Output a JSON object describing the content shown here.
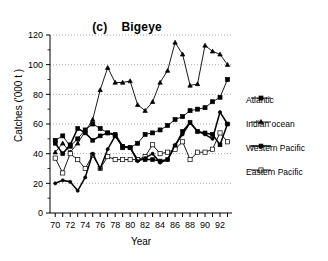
{
  "chart_data": {
    "type": "line",
    "title": "Bigeye",
    "panel_tag": "(c)",
    "xlabel": "Year",
    "ylabel": "Catches ('000 t )",
    "xlim": [
      69.3,
      93.6
    ],
    "ylim": [
      0,
      120
    ],
    "yticks": [
      0,
      20,
      40,
      60,
      80,
      100,
      120
    ],
    "xticks": [
      70,
      72,
      74,
      76,
      78,
      80,
      82,
      84,
      86,
      88,
      90,
      92
    ],
    "xtick_labels": [
      "70",
      "72",
      "74",
      "76",
      "78",
      "80",
      "82",
      "84",
      "86",
      "88",
      "90",
      "92"
    ],
    "ytick_labels": [
      "0",
      "20",
      "40",
      "60",
      "80",
      "100",
      "120"
    ],
    "grid": "horizontal-dotted",
    "legend_position": "right",
    "x": [
      70,
      71,
      72,
      73,
      74,
      75,
      76,
      77,
      78,
      79,
      80,
      81,
      82,
      83,
      84,
      85,
      86,
      87,
      88,
      89,
      90,
      91,
      92,
      93
    ],
    "series": [
      {
        "name": "Atlantic",
        "marker": "filled-square",
        "values": [
          49,
          52,
          45,
          50,
          56,
          60,
          57,
          54,
          52,
          44,
          44,
          47,
          53,
          54,
          56,
          59,
          63,
          65,
          69,
          70,
          71,
          75,
          78,
          90
        ]
      },
      {
        "name": "Indian ocean",
        "marker": "open-triangle",
        "values": [
          41,
          47,
          41,
          47,
          55,
          63,
          83,
          98,
          88,
          88,
          89,
          73,
          69,
          75,
          88,
          96,
          115,
          107,
          86,
          87,
          113,
          109,
          107,
          100
        ]
      },
      {
        "name": "Western Pacific",
        "marker": "filled-square-small",
        "values": [
          47,
          40,
          46,
          57,
          54,
          49,
          52,
          54,
          53,
          45,
          44,
          36,
          36,
          36,
          35,
          36,
          45,
          55,
          61,
          55,
          54,
          53,
          46,
          60
        ]
      },
      {
        "name": "Eastern Pacific",
        "marker": "open-square",
        "values": [
          37,
          27,
          40,
          36,
          30,
          39,
          30,
          38,
          36,
          36,
          36,
          36,
          38,
          46,
          40,
          41,
          43,
          48,
          36,
          41,
          41,
          43,
          54,
          48
        ]
      },
      {
        "name": "lower-line",
        "marker": "filled-dot",
        "values": [
          20,
          22,
          21,
          15,
          24,
          40,
          30,
          43,
          52,
          45,
          44,
          35,
          37,
          40,
          34,
          36,
          46,
          53,
          61,
          55,
          53,
          50,
          68,
          60
        ]
      }
    ]
  }
}
